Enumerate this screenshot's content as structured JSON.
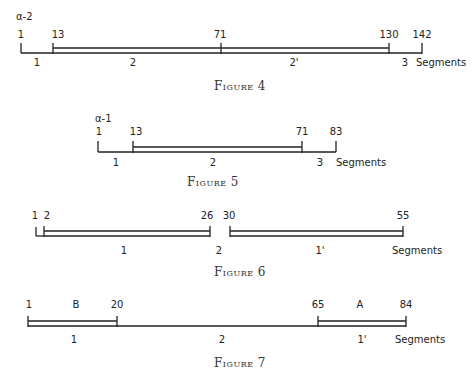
{
  "figures": [
    {
      "id": "fig4",
      "caption": "Figure 4",
      "chain_label": "α-2",
      "positions": [
        "1",
        "13",
        "71",
        "130",
        "142"
      ],
      "segments": [
        "1",
        "2",
        "2'",
        "3"
      ],
      "segments_word": "Segments"
    },
    {
      "id": "fig5",
      "caption": "Figure 5",
      "chain_label": "α-1",
      "positions": [
        "1",
        "13",
        "71",
        "83"
      ],
      "segments": [
        "1",
        "2",
        "3"
      ],
      "segments_word": "Segments"
    },
    {
      "id": "fig6",
      "caption": "Figure 6",
      "positions": [
        "1",
        "2",
        "26",
        "30",
        "55"
      ],
      "segments": [
        "1",
        "2",
        "1'"
      ],
      "segments_word": "Segments"
    },
    {
      "id": "fig7",
      "caption": "Figure 7",
      "positions": [
        "1",
        "20",
        "65",
        "84"
      ],
      "region_labels": [
        "B",
        "A"
      ],
      "segments": [
        "1",
        "2",
        "1'"
      ],
      "segments_word": "Segments"
    }
  ]
}
